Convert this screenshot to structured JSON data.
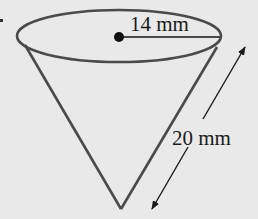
{
  "diagram": {
    "type": "cone",
    "background_color": "#e9e9e9",
    "stroke_color": "#4a4a4a",
    "labels": {
      "radius": "14 mm",
      "slant_height": "20 mm"
    },
    "measurements": {
      "radius_mm": 14,
      "slant_height_mm": 20
    }
  }
}
